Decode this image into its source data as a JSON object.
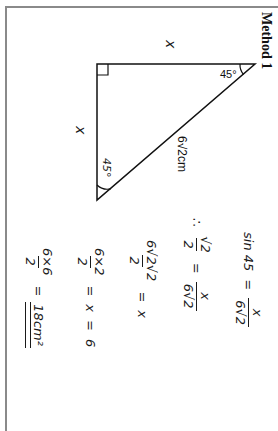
{
  "heading": "Method 1",
  "triangle": {
    "leg_top_label": "x",
    "leg_side_label": "x",
    "hypotenuse_label": "6√2cm",
    "angle_top": "45°",
    "angle_bottom": "45°",
    "right_angle": true
  },
  "working": {
    "line1": {
      "lhs": "sin 45",
      "eq": "=",
      "num": "x",
      "den": "6√2"
    },
    "line2": {
      "therefore": "∴",
      "num1": "√2",
      "den1": "2",
      "eq": "=",
      "num2": "x",
      "den2": "6√2"
    },
    "line3": {
      "num": "6√2√2",
      "den": "2",
      "eq": "=",
      "rhs": "x"
    },
    "line4": {
      "num": "6×2",
      "den": "2",
      "eq1": "=",
      "mid": "x",
      "eq2": "=",
      "rhs": "6"
    },
    "line5": {
      "num": "6×6",
      "den": "2",
      "eq": "=",
      "answer": "18cm²"
    }
  }
}
